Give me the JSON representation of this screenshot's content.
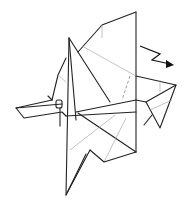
{
  "diagram": {
    "symbols": {
      "zigzag_arrow": "push / step fold arrow pointing right-down",
      "dashed_line": "hidden edge / fold line"
    },
    "colors": {
      "edge": "#222222",
      "crease": "#9a9a9a",
      "background": "#ffffff"
    }
  }
}
